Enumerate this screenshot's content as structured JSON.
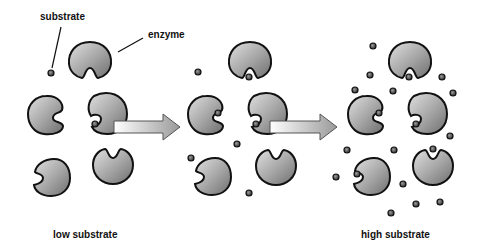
{
  "labels": {
    "substrate": "substrate",
    "enzyme": "enzyme",
    "low": "low substrate",
    "high": "high substrate"
  },
  "colors": {
    "outline": "#111111",
    "fill_light": "#d4d4d4",
    "fill_dark": "#7a7a7a",
    "arrow_light": "#f2f2f2",
    "arrow_dark": "#9a9a9a"
  },
  "panels": [
    {
      "name": "low-substrate",
      "enzymes": 5,
      "substrates_free": 1,
      "substrates_bound": 1
    },
    {
      "name": "medium-substrate",
      "enzymes": 5,
      "substrates_free": 5,
      "substrates_bound": 3
    },
    {
      "name": "high-substrate",
      "enzymes": 5,
      "substrates_free": 17,
      "substrates_bound": 5
    }
  ]
}
